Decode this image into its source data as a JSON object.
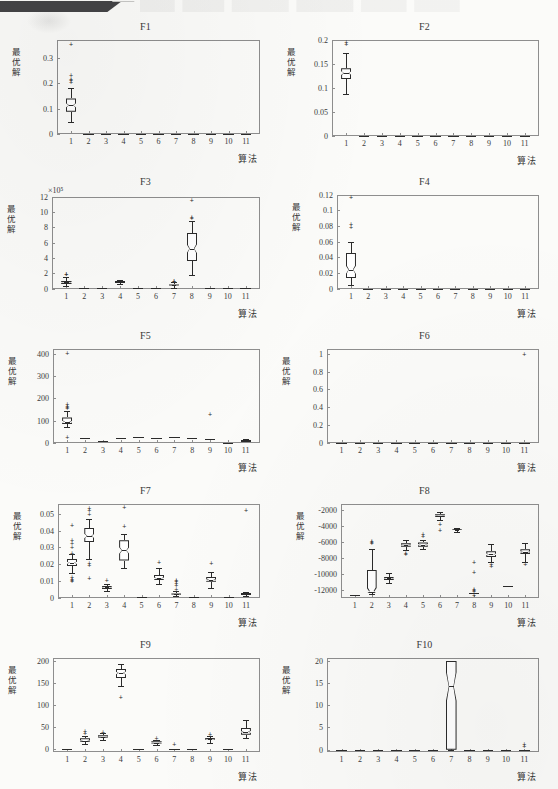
{
  "page": {
    "header_ribbon": "dark-ribbon-banner",
    "background_color": "#fbfbf9",
    "ink_color": "#2b2b2b",
    "frame_color": "#8e8e8e"
  },
  "common": {
    "ylabel": "最优解",
    "xlabel": "算法",
    "xtick_labels": [
      "1",
      "2",
      "3",
      "4",
      "5",
      "6",
      "7",
      "8",
      "9",
      "10",
      "11"
    ],
    "n_algorithms": 11
  },
  "chart_data": [
    {
      "type": "box",
      "title": "F1",
      "xlabel": "算法",
      "ylabel": "最优解",
      "categories": [
        "1",
        "2",
        "3",
        "4",
        "5",
        "6",
        "7",
        "8",
        "9",
        "10",
        "11"
      ],
      "ylim": [
        0,
        0.37
      ],
      "yticks": [
        0,
        0.1,
        0.2,
        0.3
      ],
      "ytick_labels": [
        "0",
        "0.1",
        "0.2",
        "0.3"
      ],
      "grid": false,
      "boxes": [
        {
          "x": 1,
          "min": 0.048,
          "q1": 0.088,
          "median": 0.113,
          "q3": 0.14,
          "max": 0.183,
          "outliers": [
            0.205,
            0.212,
            0.218,
            0.232,
            0.355
          ],
          "notch": true
        },
        {
          "x": 2,
          "flat": 0.0
        },
        {
          "x": 3,
          "flat": 0.0
        },
        {
          "x": 4,
          "flat": 0.0
        },
        {
          "x": 5,
          "flat": 0.0
        },
        {
          "x": 6,
          "flat": 0.0
        },
        {
          "x": 7,
          "flat": 0.0
        },
        {
          "x": 8,
          "flat": 0.0
        },
        {
          "x": 9,
          "flat": 0.0
        },
        {
          "x": 10,
          "flat": 0.0
        },
        {
          "x": 11,
          "flat": 0.0
        }
      ]
    },
    {
      "type": "box",
      "title": "F2",
      "xlabel": "算法",
      "ylabel": "最优解",
      "categories": [
        "1",
        "2",
        "3",
        "4",
        "5",
        "6",
        "7",
        "8",
        "9",
        "10",
        "11"
      ],
      "ylim": [
        0,
        0.2
      ],
      "yticks": [
        0,
        0.05,
        0.1,
        0.15,
        0.2
      ],
      "ytick_labels": [
        "0",
        "0.05",
        "0.1",
        "0.15",
        "0.2"
      ],
      "grid": false,
      "boxes": [
        {
          "x": 1,
          "min": 0.088,
          "q1": 0.118,
          "median": 0.131,
          "q3": 0.141,
          "max": 0.172,
          "outliers": [
            0.192,
            0.196
          ],
          "notch": true
        },
        {
          "x": 2,
          "flat": 0.0
        },
        {
          "x": 3,
          "flat": 0.0
        },
        {
          "x": 4,
          "flat": 0.0
        },
        {
          "x": 5,
          "flat": 0.0
        },
        {
          "x": 6,
          "flat": 0.0
        },
        {
          "x": 7,
          "flat": 0.0
        },
        {
          "x": 8,
          "flat": 0.0
        },
        {
          "x": 9,
          "flat": 0.0
        },
        {
          "x": 10,
          "flat": 0.0
        },
        {
          "x": 11,
          "flat": 0.0
        }
      ]
    },
    {
      "type": "box",
      "title": "F3",
      "xlabel": "算法",
      "ylabel": "最优解",
      "exponent_label": "×10⁵",
      "categories": [
        "1",
        "2",
        "3",
        "4",
        "5",
        "6",
        "7",
        "8",
        "9",
        "10",
        "11"
      ],
      "ylim": [
        0,
        12
      ],
      "yticks": [
        0,
        2,
        4,
        6,
        8,
        10,
        12
      ],
      "ytick_labels": [
        "0",
        "2",
        "4",
        "6",
        "8",
        "10",
        "12"
      ],
      "grid": false,
      "boxes": [
        {
          "x": 1,
          "min": 0.3,
          "q1": 0.6,
          "median": 0.8,
          "q3": 1.05,
          "max": 1.55,
          "outliers": [
            1.85,
            1.95
          ],
          "notch": true
        },
        {
          "x": 2,
          "flat": 0.08
        },
        {
          "x": 3,
          "flat": 0.14
        },
        {
          "x": 4,
          "min": 0.55,
          "q1": 0.78,
          "median": 0.86,
          "q3": 0.95,
          "max": 1.1,
          "outliers": [],
          "notch": false
        },
        {
          "x": 5,
          "flat": 0.08
        },
        {
          "x": 6,
          "flat": 0.12
        },
        {
          "x": 7,
          "min": 0.1,
          "q1": 0.32,
          "median": 0.42,
          "q3": 0.55,
          "max": 0.82,
          "outliers": [
            0.95,
            1.02
          ],
          "notch": true
        },
        {
          "x": 8,
          "min": 1.75,
          "q1": 3.6,
          "median": 5.2,
          "q3": 7.3,
          "max": 8.85,
          "outliers": [
            9.25,
            9.35,
            11.6
          ],
          "notch": true
        },
        {
          "x": 9,
          "flat": 0.12
        },
        {
          "x": 10,
          "flat": 0.05
        },
        {
          "x": 11,
          "flat": 0.12
        }
      ]
    },
    {
      "type": "box",
      "title": "F4",
      "xlabel": "算法",
      "ylabel": "最优解",
      "categories": [
        "1",
        "2",
        "3",
        "4",
        "5",
        "6",
        "7",
        "8",
        "9",
        "10",
        "11"
      ],
      "ylim": [
        0,
        0.12
      ],
      "yticks": [
        0,
        0.02,
        0.04,
        0.06,
        0.08,
        0.1,
        0.12
      ],
      "ytick_labels": [
        "0",
        "0.02",
        "0.04",
        "0.06",
        "0.08",
        "0.1",
        "0.12"
      ],
      "grid": false,
      "boxes": [
        {
          "x": 1,
          "min": 0.004,
          "q1": 0.013,
          "median": 0.024,
          "q3": 0.046,
          "max": 0.06,
          "outliers": [
            0.079,
            0.082,
            0.117
          ],
          "notch": true
        },
        {
          "x": 2,
          "flat": 0.0
        },
        {
          "x": 3,
          "flat": 0.0
        },
        {
          "x": 4,
          "flat": 0.0
        },
        {
          "x": 5,
          "flat": 0.0
        },
        {
          "x": 6,
          "flat": 0.0
        },
        {
          "x": 7,
          "flat": 0.0
        },
        {
          "x": 8,
          "flat": 0.0
        },
        {
          "x": 9,
          "flat": 0.0
        },
        {
          "x": 10,
          "flat": 0.0
        },
        {
          "x": 11,
          "flat": 0.0
        }
      ]
    },
    {
      "type": "box",
      "title": "F5",
      "xlabel": "算法",
      "ylabel": "最优解",
      "categories": [
        "1",
        "2",
        "3",
        "4",
        "5",
        "6",
        "7",
        "8",
        "9",
        "10",
        "11"
      ],
      "ylim": [
        0,
        420
      ],
      "yticks": [
        0,
        100,
        200,
        300,
        400
      ],
      "ytick_labels": [
        "0",
        "100",
        "200",
        "300",
        "400"
      ],
      "grid": false,
      "boxes": [
        {
          "x": 1,
          "min": 72,
          "q1": 85,
          "median": 95,
          "q3": 115,
          "max": 145,
          "outliers": [
            26,
            155,
            162,
            168,
            175,
            405
          ],
          "notch": true
        },
        {
          "x": 2,
          "flat": 22
        },
        {
          "x": 3,
          "flat": 8
        },
        {
          "x": 4,
          "flat": 25
        },
        {
          "x": 5,
          "flat": 27
        },
        {
          "x": 6,
          "flat": 22
        },
        {
          "x": 7,
          "flat": 28
        },
        {
          "x": 8,
          "flat": 25
        },
        {
          "x": 9,
          "flat": 18,
          "outliers": [
            132
          ]
        },
        {
          "x": 10,
          "flat": 3
        },
        {
          "x": 11,
          "min": 8,
          "q1": 11,
          "median": 13,
          "q3": 16,
          "max": 20,
          "outliers": [],
          "notch": false
        }
      ]
    },
    {
      "type": "box",
      "title": "F6",
      "xlabel": "算法",
      "ylabel": "最优解",
      "categories": [
        "1",
        "2",
        "3",
        "4",
        "5",
        "6",
        "7",
        "8",
        "9",
        "10",
        "11"
      ],
      "ylim": [
        0,
        1.05
      ],
      "yticks": [
        0,
        0.2,
        0.4,
        0.6,
        0.8,
        1
      ],
      "ytick_labels": [
        "0",
        "0.2",
        "0.4",
        "0.6",
        "0.8",
        "1"
      ],
      "grid": false,
      "boxes": [
        {
          "x": 1,
          "flat": 0.0
        },
        {
          "x": 2,
          "flat": 0.0
        },
        {
          "x": 3,
          "flat": 0.0
        },
        {
          "x": 4,
          "flat": 0.0
        },
        {
          "x": 5,
          "flat": 0.0
        },
        {
          "x": 6,
          "flat": 0.0
        },
        {
          "x": 7,
          "flat": 0.0
        },
        {
          "x": 8,
          "flat": 0.0
        },
        {
          "x": 9,
          "flat": 0.0
        },
        {
          "x": 10,
          "flat": 0.0
        },
        {
          "x": 11,
          "flat": 0.0,
          "outliers": [
            1.0
          ]
        }
      ]
    },
    {
      "type": "box",
      "title": "F7",
      "xlabel": "算法",
      "ylabel": "最优解",
      "categories": [
        "1",
        "2",
        "3",
        "4",
        "5",
        "6",
        "7",
        "8",
        "9",
        "10",
        "11"
      ],
      "ylim": [
        0,
        0.056
      ],
      "yticks": [
        0,
        0.01,
        0.02,
        0.03,
        0.04,
        0.05
      ],
      "ytick_labels": [
        "0",
        "0.01",
        "0.02",
        "0.03",
        "0.04",
        "0.05"
      ],
      "grid": false,
      "boxes": [
        {
          "x": 1,
          "min": 0.0145,
          "q1": 0.0188,
          "median": 0.0208,
          "q3": 0.0232,
          "max": 0.0258,
          "outliers": [
            0.0098,
            0.0105,
            0.0112,
            0.0122,
            0.0268,
            0.03,
            0.0325,
            0.0345,
            0.0432
          ],
          "notch": true
        },
        {
          "x": 2,
          "min": 0.0232,
          "q1": 0.033,
          "median": 0.0368,
          "q3": 0.0415,
          "max": 0.0468,
          "outliers": [
            0.0118,
            0.0195,
            0.021,
            0.05,
            0.052,
            0.0535
          ],
          "notch": true
        },
        {
          "x": 3,
          "min": 0.0042,
          "q1": 0.0053,
          "median": 0.0062,
          "q3": 0.0072,
          "max": 0.0085,
          "outliers": [
            0.0108
          ],
          "notch": true
        },
        {
          "x": 4,
          "min": 0.0175,
          "q1": 0.0222,
          "median": 0.0282,
          "q3": 0.0342,
          "max": 0.0382,
          "outliers": [
            0.0425,
            0.054
          ],
          "notch": true
        },
        {
          "x": 5,
          "flat": 0.0002
        },
        {
          "x": 6,
          "min": 0.008,
          "q1": 0.0103,
          "median": 0.0115,
          "q3": 0.0138,
          "max": 0.0178,
          "outliers": [
            0.0212
          ],
          "notch": true
        },
        {
          "x": 7,
          "min": 0.001,
          "q1": 0.0016,
          "median": 0.002,
          "q3": 0.0026,
          "max": 0.0038,
          "outliers": [
            0.0055,
            0.0075,
            0.0088,
            0.0098,
            0.0108
          ],
          "notch": true
        },
        {
          "x": 8,
          "flat": 0.0005
        },
        {
          "x": 9,
          "min": 0.006,
          "q1": 0.0095,
          "median": 0.0105,
          "q3": 0.0125,
          "max": 0.0155,
          "outliers": [
            0.0205
          ],
          "notch": true
        },
        {
          "x": 10,
          "flat": 0.0002
        },
        {
          "x": 11,
          "min": 0.0012,
          "q1": 0.0018,
          "median": 0.0022,
          "q3": 0.0026,
          "max": 0.0032,
          "outliers": [
            0.052
          ],
          "notch": false
        }
      ]
    },
    {
      "type": "box",
      "title": "F8",
      "xlabel": "算法",
      "ylabel": "最优解",
      "categories": [
        "1",
        "2",
        "3",
        "4",
        "5",
        "6",
        "7",
        "8",
        "9",
        "10",
        "11"
      ],
      "ylim": [
        -13000,
        -1200
      ],
      "yticks": [
        -2000,
        -4000,
        -6000,
        -8000,
        -10000,
        -12000
      ],
      "ytick_labels": [
        "-2000",
        "-4000",
        "-6000",
        "-8000",
        "-10000",
        "-12000"
      ],
      "grid": false,
      "boxes": [
        {
          "x": 1,
          "flat": -12700
        },
        {
          "x": 2,
          "min": -12550,
          "q1": -12450,
          "median": -12250,
          "q3": -9450,
          "max": -6900,
          "outliers": [
            -6150,
            -5950,
            -5850
          ],
          "notch": true
        },
        {
          "x": 3,
          "min": -11100,
          "q1": -10800,
          "median": -10550,
          "q3": -10350,
          "max": -9950,
          "outliers": [],
          "notch": true
        },
        {
          "x": 4,
          "min": -6950,
          "q1": -6600,
          "median": -6400,
          "q3": -6150,
          "max": -5800,
          "outliers": [
            -7400,
            -7550
          ],
          "notch": true
        },
        {
          "x": 5,
          "min": -6900,
          "q1": -6600,
          "median": -6350,
          "q3": -6050,
          "max": -5700,
          "outliers": [
            -5050,
            -5200
          ],
          "notch": true
        },
        {
          "x": 6,
          "min": -3200,
          "q1": -2900,
          "median": -2700,
          "q3": -2500,
          "max": -2200,
          "outliers": [
            -3750,
            -4450
          ],
          "notch": true
        },
        {
          "x": 7,
          "min": -4700,
          "q1": -4550,
          "median": -4450,
          "q3": -4350,
          "max": -4200,
          "outliers": [],
          "notch": true
        },
        {
          "x": 8,
          "flat": -12450,
          "outliers": [
            -11950,
            -12050,
            -12150,
            -12700,
            -9750,
            -8550
          ]
        },
        {
          "x": 9,
          "min": -8450,
          "q1": -7900,
          "median": -7550,
          "q3": -7150,
          "max": -6300,
          "outliers": [
            -8800,
            -8950
          ],
          "notch": true
        },
        {
          "x": 10,
          "flat": -11500
        },
        {
          "x": 11,
          "min": -8450,
          "q1": -7550,
          "median": -7250,
          "q3": -6900,
          "max": -6100,
          "outliers": [
            -8800
          ],
          "notch": true
        }
      ]
    },
    {
      "type": "box",
      "title": "F9",
      "xlabel": "算法",
      "ylabel": "最优解",
      "categories": [
        "1",
        "2",
        "3",
        "4",
        "5",
        "6",
        "7",
        "8",
        "9",
        "10",
        "11"
      ],
      "ylim": [
        -8,
        205
      ],
      "yticks": [
        0,
        50,
        100,
        150,
        200
      ],
      "ytick_labels": [
        "0",
        "50",
        "100",
        "150",
        "200"
      ],
      "grid": false,
      "boxes": [
        {
          "x": 1,
          "flat": 0
        },
        {
          "x": 2,
          "min": 10,
          "q1": 15,
          "median": 18,
          "q3": 24,
          "max": 30,
          "outliers": [
            36,
            40
          ],
          "notch": true
        },
        {
          "x": 3,
          "min": 21,
          "q1": 25,
          "median": 27,
          "q3": 31,
          "max": 35,
          "outliers": [
            38
          ],
          "notch": true
        },
        {
          "x": 4,
          "min": 142,
          "q1": 160,
          "median": 172,
          "q3": 182,
          "max": 192,
          "outliers": [
            117
          ],
          "notch": true
        },
        {
          "x": 5,
          "flat": 0
        },
        {
          "x": 6,
          "min": 8,
          "q1": 12,
          "median": 14,
          "q3": 17,
          "max": 21,
          "outliers": [
            25
          ],
          "notch": true
        },
        {
          "x": 7,
          "flat": 0,
          "outliers": [
            11
          ]
        },
        {
          "x": 8,
          "flat": 0
        },
        {
          "x": 9,
          "min": 14,
          "q1": 19,
          "median": 22,
          "q3": 25,
          "max": 29,
          "outliers": [
            33
          ],
          "notch": true
        },
        {
          "x": 10,
          "flat": 0
        },
        {
          "x": 11,
          "min": 25,
          "q1": 32,
          "median": 38,
          "q3": 47,
          "max": 65,
          "outliers": [],
          "notch": true
        }
      ]
    },
    {
      "type": "box",
      "title": "F10",
      "xlabel": "算法",
      "ylabel": "最优解",
      "categories": [
        "1",
        "2",
        "3",
        "4",
        "5",
        "6",
        "7",
        "8",
        "9",
        "10",
        "11"
      ],
      "ylim": [
        -0.6,
        20.5
      ],
      "yticks": [
        0,
        5,
        10,
        15,
        20
      ],
      "ytick_labels": [
        "0",
        "5",
        "10",
        "15",
        "20"
      ],
      "grid": false,
      "boxes": [
        {
          "x": 1,
          "flat": 0
        },
        {
          "x": 2,
          "flat": 0
        },
        {
          "x": 3,
          "flat": 0
        },
        {
          "x": 4,
          "flat": 0
        },
        {
          "x": 5,
          "flat": 0
        },
        {
          "x": 6,
          "flat": 0
        },
        {
          "x": 7,
          "min": 0,
          "q1": 0,
          "median": 14.2,
          "q3": 20,
          "max": 20,
          "outliers": [],
          "notch": true
        },
        {
          "x": 8,
          "flat": 0
        },
        {
          "x": 9,
          "flat": 0
        },
        {
          "x": 10,
          "flat": 0
        },
        {
          "x": 11,
          "flat": 0,
          "outliers": [
            0.9,
            1.2
          ]
        }
      ]
    }
  ]
}
